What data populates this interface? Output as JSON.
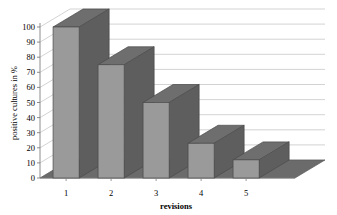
{
  "chart_data": {
    "type": "bar",
    "title": "",
    "subtitle": "",
    "categories": [
      "1",
      "2",
      "3",
      "4",
      "5"
    ],
    "values": [
      100,
      75,
      50,
      23,
      12
    ],
    "series": [
      {
        "name": "positive cultures",
        "values": [
          100,
          75,
          50,
          23,
          12
        ]
      }
    ],
    "xlabel": "revisions",
    "ylabel": "positive cultures in %",
    "ylim": [
      0,
      100
    ],
    "ytick_step": 10,
    "yticks": [
      0,
      10,
      20,
      30,
      40,
      50,
      60,
      70,
      80,
      90,
      100
    ],
    "ytick_labels": [
      "0",
      "10",
      "20",
      "30",
      "40",
      "50",
      "60",
      "70",
      "80",
      "90",
      "100"
    ],
    "grid": true,
    "grid_axis": "y",
    "legend": false,
    "legend_position": "none",
    "style": "3d-column",
    "annotations": []
  },
  "colors": {
    "background": "#ffffff",
    "gridline": "#c8c8c8",
    "axis": "#808080",
    "bar_front": "#9a9a9a",
    "bar_side": "#5e5e5e",
    "bar_top": "#6e6e6e",
    "bar_outline": "#4a4a4a",
    "floor": "#6b6b6b",
    "floor_edge": "#555555",
    "text": "#000000"
  },
  "axis": {
    "y_title": "positive cultures in %",
    "x_title": "revisions"
  }
}
